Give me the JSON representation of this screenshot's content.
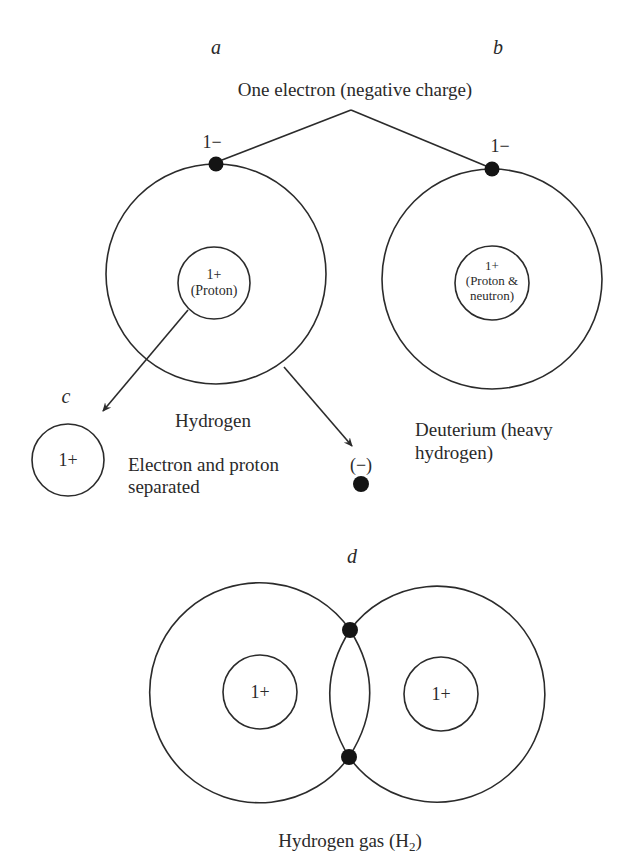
{
  "colors": {
    "ink": "#2b2b2b",
    "electron": "#141414",
    "background": "#ffffff"
  },
  "panel_a": {
    "letter": "a",
    "electron_charge": "1−",
    "nucleus_line1": "1+",
    "nucleus_line2": "(Proton)",
    "caption": "Hydrogen"
  },
  "panel_b": {
    "letter": "b",
    "electron_charge": "1−",
    "nucleus_line1": "1+",
    "nucleus_line2": "(Proton &",
    "nucleus_line3": "neutron)",
    "caption_line1": "Deuterium (heavy",
    "caption_line2": "hydrogen)"
  },
  "shared": {
    "electron_callout": "One electron (negative charge)"
  },
  "panel_c": {
    "letter": "c",
    "proton_charge": "1+",
    "electron_charge": "(−)",
    "caption_line1": "Electron and proton",
    "caption_line2": "separated"
  },
  "panel_d": {
    "letter": "d",
    "left_nucleus": "1+",
    "right_nucleus": "1+",
    "caption": "Hydrogen gas (H",
    "caption_subscript": "2",
    "caption_close": ")"
  }
}
